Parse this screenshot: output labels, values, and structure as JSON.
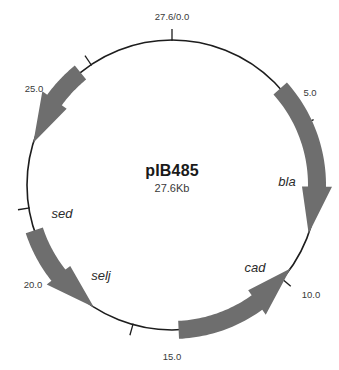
{
  "figure": {
    "type": "plasmid-map",
    "center": {
      "name": "pIB485",
      "size": "27.6Kb"
    },
    "geometry": {
      "cx": 172,
      "cy": 185,
      "radius": 145,
      "total_kb": 27.6
    },
    "colors": {
      "backbone": "#1d1d1d",
      "gene_fill": "#6e6e6e",
      "label_text": "#2b2b2b",
      "tick_text": "#3a3a3a",
      "background": "#ffffff"
    },
    "ticks": [
      {
        "label": "27.6/0.0",
        "kb": 0.0,
        "x": 172,
        "y": 20,
        "anchor": "middle"
      },
      {
        "label": "5.0",
        "kb": 5.0,
        "x": 310,
        "y": 96,
        "anchor": "middle"
      },
      {
        "label": "10.0",
        "kb": 10.0,
        "x": 311,
        "y": 298,
        "anchor": "middle"
      },
      {
        "label": "15.0",
        "kb": 15.0,
        "x": 172,
        "y": 360,
        "anchor": "middle"
      },
      {
        "label": "20.0",
        "kb": 20.0,
        "x": 33,
        "y": 288,
        "anchor": "middle"
      },
      {
        "label": "25.0",
        "kb": 25.0,
        "x": 34,
        "y": 92,
        "anchor": "middle"
      }
    ],
    "genes": [
      {
        "name": "bla",
        "direction": "clockwise",
        "start_kb": 3.7,
        "end_kb": 8.4,
        "label_x": 287,
        "label_y": 186
      },
      {
        "name": "cad",
        "direction": "counter-clockwise",
        "start_kb": 13.6,
        "end_kb": 9.6,
        "label_x": 255,
        "label_y": 272
      },
      {
        "name": "selj",
        "direction": "clockwise",
        "start_kb": 19.3,
        "end_kb": 16.3,
        "label_x": 101,
        "label_y": 280
      },
      {
        "name": "sed",
        "direction": "clockwise",
        "start_kb": 24.6,
        "end_kb": 22.0,
        "label_x": 62,
        "label_y": 218
      }
    ]
  }
}
